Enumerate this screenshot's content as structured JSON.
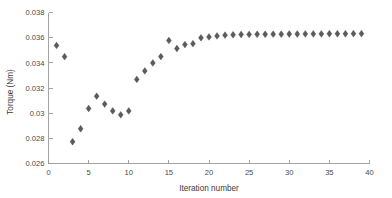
{
  "chart_data": {
    "type": "scatter",
    "title": "",
    "xlabel": "Iteration number",
    "ylabel": "Torque (Nm)",
    "xlim": [
      0,
      40
    ],
    "ylim": [
      0.026,
      0.038
    ],
    "xticks": [
      0,
      5,
      10,
      15,
      20,
      25,
      30,
      35,
      40
    ],
    "xticklabels": [
      "0",
      "5",
      "10",
      "15",
      "20",
      "25",
      "30",
      "35",
      "40"
    ],
    "yticks": [
      0.026,
      0.028,
      0.03,
      0.032,
      0.034,
      0.036,
      0.038
    ],
    "yticklabels": [
      "0.026",
      "0.028",
      "0.03",
      "0.032",
      "0.034",
      "0.036",
      "0.038"
    ],
    "grid": false,
    "legend": null,
    "marker": "diamond",
    "marker_color": "#5b5b5b",
    "x": [
      1,
      2,
      3,
      4,
      5,
      6,
      7,
      8,
      9,
      10,
      11,
      12,
      13,
      14,
      15,
      16,
      17,
      18,
      19,
      20,
      21,
      22,
      23,
      24,
      25,
      26,
      27,
      28,
      29,
      30,
      31,
      32,
      33,
      34,
      35,
      36,
      37,
      38,
      39
    ],
    "y": [
      0.03538,
      0.03449,
      0.02773,
      0.02876,
      0.03037,
      0.03135,
      0.03072,
      0.03018,
      0.02987,
      0.03018,
      0.03268,
      0.03336,
      0.03399,
      0.0345,
      0.03578,
      0.03514,
      0.03545,
      0.03552,
      0.03599,
      0.03606,
      0.03614,
      0.0362,
      0.03623,
      0.03625,
      0.03626,
      0.03627,
      0.03627,
      0.03628,
      0.03628,
      0.03629,
      0.03629,
      0.0363,
      0.0363,
      0.0363,
      0.03631,
      0.03631,
      0.03631,
      0.03632,
      0.03632
    ]
  },
  "axes": {
    "ylabel_text": "Torque (Nm)",
    "xlabel_text": "Iteration number"
  }
}
